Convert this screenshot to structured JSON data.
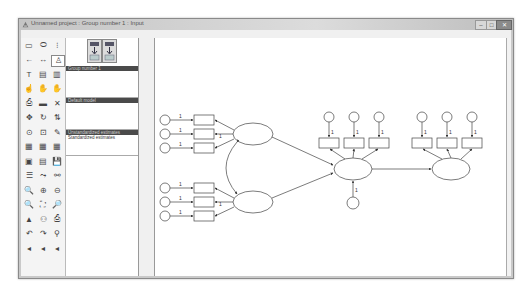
{
  "window": {
    "title": "Unnamed project : Group number 1 : Input",
    "controls": {
      "minimize": "–",
      "maximize": "□",
      "close": "✕"
    }
  },
  "menubar": {
    "items": [
      "File",
      "Edit",
      "View",
      "Diagram",
      "Analyze",
      "Tools",
      "Plugins",
      "Help"
    ]
  },
  "toolbox": {
    "tools": [
      {
        "name": "draw-observed-variable-icon",
        "glyph": "▭"
      },
      {
        "name": "draw-unobserved-variable-icon",
        "glyph": "⬭"
      },
      {
        "name": "draw-latent-with-indicators-icon",
        "glyph": "⁝"
      },
      {
        "name": "draw-path-icon",
        "glyph": "←"
      },
      {
        "name": "draw-covariance-icon",
        "glyph": "↔"
      },
      {
        "name": "add-unique-variable-icon",
        "glyph": "♙"
      },
      {
        "name": "figure-caption-icon",
        "glyph": "T"
      },
      {
        "name": "list-variables-in-model-icon",
        "glyph": "▤"
      },
      {
        "name": "list-variables-in-dataset-icon",
        "glyph": "▥"
      },
      {
        "name": "select-one-object-icon",
        "glyph": "☝"
      },
      {
        "name": "select-all-objects-icon",
        "glyph": "✋"
      },
      {
        "name": "deselect-all-objects-icon",
        "glyph": "✋"
      },
      {
        "name": "duplicate-objects-icon",
        "glyph": "⎙"
      },
      {
        "name": "move-objects-icon",
        "glyph": "▬"
      },
      {
        "name": "erase-objects-icon",
        "glyph": "✕"
      },
      {
        "name": "change-shape-icon",
        "glyph": "✥"
      },
      {
        "name": "rotate-indicators-icon",
        "glyph": "↻"
      },
      {
        "name": "reflect-indicators-icon",
        "glyph": "⇅"
      },
      {
        "name": "move-parameter-values-icon",
        "glyph": "⊙"
      },
      {
        "name": "reposition-diagram-icon",
        "glyph": "⊡"
      },
      {
        "name": "touch-up-variable-icon",
        "glyph": "✎"
      },
      {
        "name": "select-data-files-icon",
        "glyph": "▦"
      },
      {
        "name": "analysis-properties-icon",
        "glyph": "▦"
      },
      {
        "name": "calculate-estimates-icon",
        "glyph": "▦"
      },
      {
        "name": "copy-diagram-icon",
        "glyph": "▣"
      },
      {
        "name": "view-text-output-icon",
        "glyph": "▤"
      },
      {
        "name": "save-diagram-icon",
        "glyph": "💾"
      },
      {
        "name": "object-properties-icon",
        "glyph": "☰"
      },
      {
        "name": "drag-properties-icon",
        "glyph": "⤳"
      },
      {
        "name": "preserve-symmetries-icon",
        "glyph": "⚯"
      },
      {
        "name": "zoom-in-area-icon",
        "glyph": "🔍"
      },
      {
        "name": "zoom-in-icon",
        "glyph": "⊕"
      },
      {
        "name": "zoom-out-icon",
        "glyph": "⊖"
      },
      {
        "name": "zoom-page-icon",
        "glyph": "🔍"
      },
      {
        "name": "fit-to-page-icon",
        "glyph": "⛶"
      },
      {
        "name": "loupe-icon",
        "glyph": "🔎"
      },
      {
        "name": "bayesian-estimation-icon",
        "glyph": "▲"
      },
      {
        "name": "multiple-group-analysis-icon",
        "glyph": "⚇"
      },
      {
        "name": "print-diagram-icon",
        "glyph": "⎙"
      },
      {
        "name": "undo-icon",
        "glyph": "↶"
      },
      {
        "name": "redo-icon",
        "glyph": "↷"
      },
      {
        "name": "specification-search-icon",
        "glyph": "⚲"
      },
      {
        "name": "scroll-left-icon",
        "glyph": "◂"
      },
      {
        "name": "scroll-left-icon-2",
        "glyph": "◂"
      },
      {
        "name": "scroll-left-icon-3",
        "glyph": "◂"
      }
    ]
  },
  "panels": {
    "path_buttons": [
      {
        "label": "input path diagram"
      },
      {
        "label": "output path diagram"
      }
    ],
    "groups": {
      "header": "Group number 1"
    },
    "models": {
      "header": "Default model"
    },
    "estimates": {
      "header": "Unstandardized estimates",
      "options": [
        "Unstandardized estimates",
        "Standardized estimates"
      ]
    }
  },
  "diagram": {
    "path_constraint_label": "1",
    "latent_factors": 4,
    "observed_indicators": 11,
    "error_terms": 12
  }
}
